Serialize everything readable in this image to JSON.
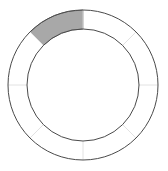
{
  "widget": {
    "name": "segmented-ring-indicator",
    "background_color": "#ffffff"
  },
  "chart_data": {
    "type": "pie",
    "title": "",
    "subtitle": "",
    "xlabel": "",
    "ylabel": "",
    "legend": [],
    "annotations": [],
    "grid": false,
    "variant": "donut-segmented-gauge",
    "segment_count": 8,
    "segment_angle_deg": 45,
    "start_angle_deg": -90,
    "filled_count": 1,
    "filled_indices": [
      7
    ],
    "categories": [
      "seg-1",
      "seg-2",
      "seg-3",
      "seg-4",
      "seg-5",
      "seg-6",
      "seg-7",
      "seg-8"
    ],
    "values": [
      0,
      0,
      0,
      0,
      0,
      0,
      0,
      1
    ],
    "fill_color": "#a8a8a8",
    "empty_color": "#ffffff",
    "outline_color": "#4a4a4a",
    "divider_color": "#e2e2e2",
    "filled_segment_outline_color": "#6f6f6f",
    "geometry": {
      "center_x": 83,
      "center_y": 85,
      "outer_radius": 75,
      "inner_radius": 56,
      "stroke_width": 1
    }
  }
}
